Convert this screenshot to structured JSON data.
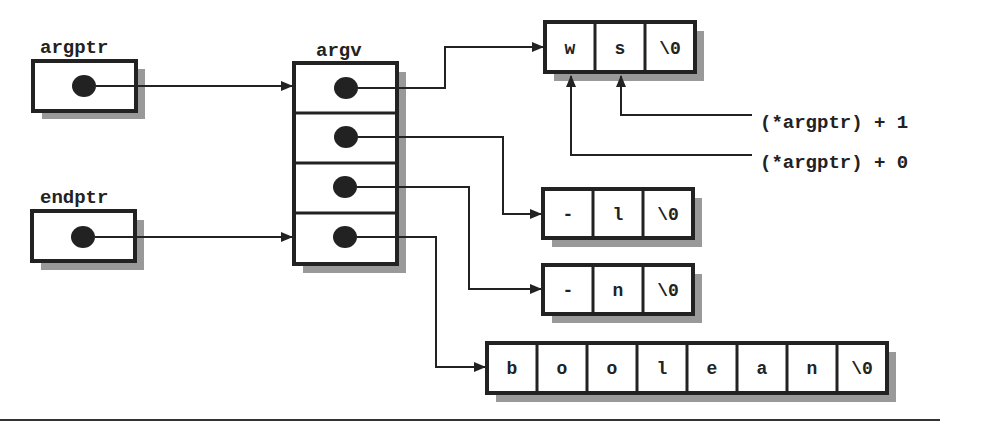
{
  "diagram": {
    "colors": {
      "stroke": "#222222",
      "shadow": "#999999",
      "fill": "#ffffff"
    },
    "pointers": [
      {
        "name": "argptr",
        "label": "argptr",
        "target": "argv[0]"
      },
      {
        "name": "endptr",
        "label": "endptr",
        "target": "argv[3]"
      }
    ],
    "argv": {
      "label": "argv",
      "cells": 4
    },
    "strings": [
      {
        "id": "s0",
        "chars": [
          "w",
          "s",
          "\\0"
        ]
      },
      {
        "id": "s1",
        "chars": [
          "-",
          "l",
          "\\0"
        ]
      },
      {
        "id": "s2",
        "chars": [
          "-",
          "n",
          "\\0"
        ]
      },
      {
        "id": "s3",
        "chars": [
          "b",
          "o",
          "o",
          "l",
          "e",
          "a",
          "n",
          "\\0"
        ]
      }
    ],
    "annotations": [
      {
        "text": "(*argptr) + 1",
        "points_to": "s0[1]"
      },
      {
        "text": "(*argptr) + 0",
        "points_to": "s0[0]"
      }
    ]
  }
}
